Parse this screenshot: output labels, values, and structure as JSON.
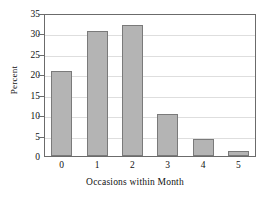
{
  "chart_data": {
    "type": "bar",
    "title": "",
    "xlabel": "Occasions within Month",
    "ylabel": "Percent",
    "categories": [
      "0",
      "1",
      "2",
      "3",
      "4",
      "5"
    ],
    "values": [
      20.8,
      30.5,
      32.0,
      10.3,
      4.2,
      1.2
    ],
    "ylim": [
      0,
      35
    ],
    "yticks": [
      0,
      5,
      10,
      15,
      20,
      25,
      30,
      35
    ],
    "ytick_labels": [
      "0",
      "5",
      "10",
      "15",
      "20",
      "25",
      "30",
      "35"
    ],
    "grid": true,
    "legend": null,
    "bar_color": "#b4b4b4",
    "bar_border_color": "#7a7a7a",
    "axis_color": "#6b6b6b",
    "grid_color": "#dedede",
    "text_color": "#111111",
    "background": "#ffffff"
  }
}
